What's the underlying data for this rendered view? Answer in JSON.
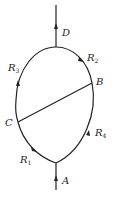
{
  "diagram": {
    "type": "circuit",
    "nodes": {
      "A": "A",
      "B": "B",
      "C": "C",
      "D": "D"
    },
    "resistors": {
      "R1": {
        "letter": "R",
        "sub": "1"
      },
      "R2": {
        "letter": "R",
        "sub": "2"
      },
      "R3": {
        "letter": "R",
        "sub": "3"
      },
      "R4": {
        "letter": "R",
        "sub": "4"
      }
    },
    "colors": {
      "stroke": "#222222",
      "background": "#ffffff"
    }
  }
}
